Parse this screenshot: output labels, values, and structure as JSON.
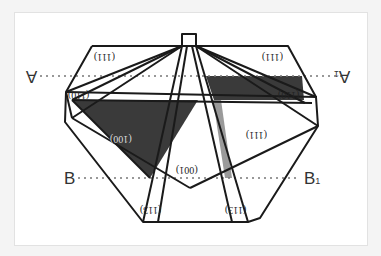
{
  "diagram": {
    "title": "",
    "colors": {
      "background": "#ffffff",
      "outer": "#f4f4f4",
      "stroke": "#1a1a1a",
      "dark_face": "#3a3a3a",
      "light_face": "#9a9a9a",
      "dotted_line": "#777777"
    },
    "faces": [
      {
        "id": "face-111-top-left",
        "label": "(111)"
      },
      {
        "id": "face-111-top-right",
        "label": "(111)"
      },
      {
        "id": "face-110-left",
        "label": "(110)"
      },
      {
        "id": "face-110-right",
        "label": "(110)"
      },
      {
        "id": "face-100-dark",
        "label": "(100)"
      },
      {
        "id": "face-111-lower-right",
        "label": "(111)"
      },
      {
        "id": "face-001-center",
        "label": "(001)"
      },
      {
        "id": "face-113-left",
        "label": "(113)"
      },
      {
        "id": "face-113-right",
        "label": "(113)"
      }
    ],
    "section_lines": [
      {
        "id": "A-A1",
        "start": "A",
        "end": "A",
        "end_subscript": "1"
      },
      {
        "id": "B-B1",
        "start": "B",
        "end": "B",
        "end_subscript": "1"
      }
    ]
  }
}
